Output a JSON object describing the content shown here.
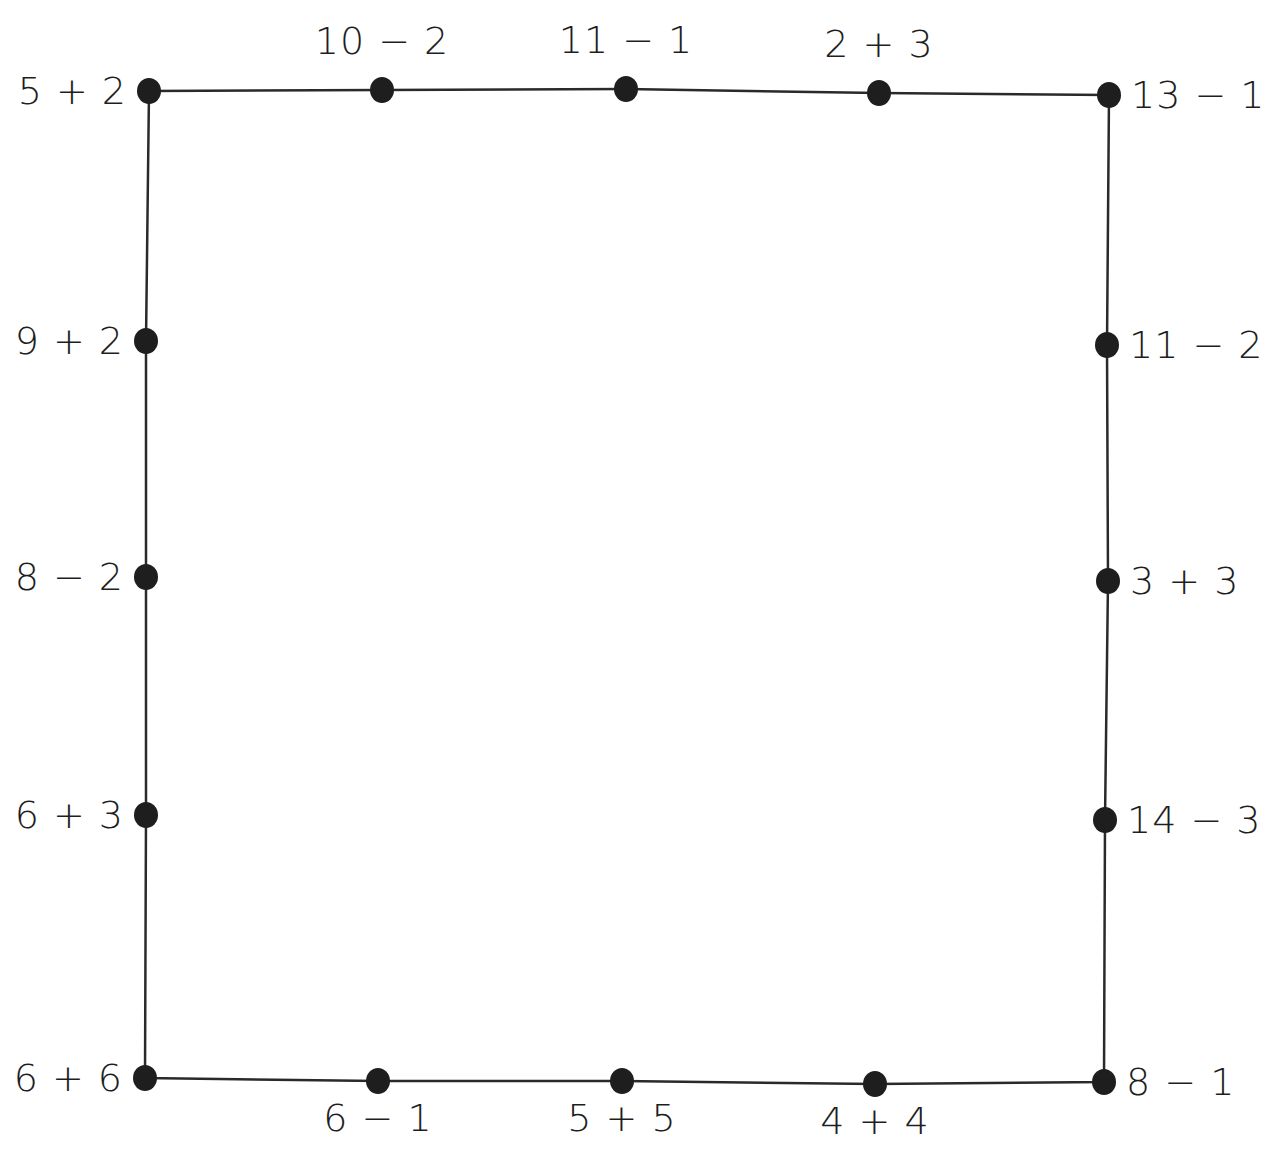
{
  "diagram": {
    "type": "connect-the-dots path",
    "line_color": "#2a2a2a",
    "dot_color": "#1e1e1e",
    "label_color": "#1e1e1e",
    "background": "#ffffff",
    "points": [
      {
        "id": 0,
        "x": 149,
        "y": 91,
        "label": "5 + 2",
        "label_pos": "left"
      },
      {
        "id": 1,
        "x": 382,
        "y": 90,
        "label": "10 − 2",
        "label_pos": "above"
      },
      {
        "id": 2,
        "x": 626,
        "y": 89,
        "label": "11 − 1",
        "label_pos": "above"
      },
      {
        "id": 3,
        "x": 879,
        "y": 93,
        "label": "2 + 3",
        "label_pos": "above"
      },
      {
        "id": 4,
        "x": 1109,
        "y": 95,
        "label": "13 − 1",
        "label_pos": "right"
      },
      {
        "id": 5,
        "x": 1107,
        "y": 345,
        "label": "11 − 2",
        "label_pos": "right"
      },
      {
        "id": 6,
        "x": 1108,
        "y": 581,
        "label": "3 + 3",
        "label_pos": "right"
      },
      {
        "id": 7,
        "x": 1105,
        "y": 820,
        "label": "14 − 3",
        "label_pos": "right"
      },
      {
        "id": 8,
        "x": 1104,
        "y": 1082,
        "label": "8 − 1",
        "label_pos": "right"
      },
      {
        "id": 9,
        "x": 875,
        "y": 1084,
        "label": "4 + 4",
        "label_pos": "below"
      },
      {
        "id": 10,
        "x": 622,
        "y": 1081,
        "label": "5 + 5",
        "label_pos": "below"
      },
      {
        "id": 11,
        "x": 378,
        "y": 1081,
        "label": "6 − 1",
        "label_pos": "below"
      },
      {
        "id": 12,
        "x": 145,
        "y": 1078,
        "label": "6 + 6",
        "label_pos": "left"
      },
      {
        "id": 13,
        "x": 146,
        "y": 815,
        "label": "6 + 3",
        "label_pos": "left"
      },
      {
        "id": 14,
        "x": 146,
        "y": 577,
        "label": "8 − 2",
        "label_pos": "left"
      },
      {
        "id": 15,
        "x": 146,
        "y": 341,
        "label": "9 + 2",
        "label_pos": "left"
      }
    ]
  }
}
